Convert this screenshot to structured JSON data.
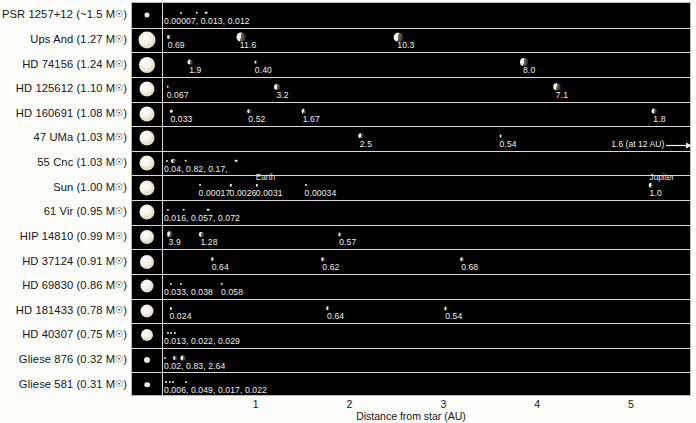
{
  "axis": {
    "title": "Distance from star (AU)",
    "ticks": [
      "1",
      "2",
      "3",
      "4",
      "5"
    ],
    "tick_values": [
      1,
      2,
      3,
      4,
      5
    ],
    "xmin": 0,
    "xmax": 5.62
  },
  "notes": {
    "earth_label": "Earth",
    "jupiter_label": "Jupiter",
    "uma_offscale": "1.6 (at 12 AU)"
  },
  "chart_data": {
    "type": "scatter",
    "title": "",
    "xlabel": "Distance from star (AU)",
    "ylabel": "",
    "xlim": [
      0,
      5.62
    ],
    "grid": false,
    "legend": "none",
    "value_units": "planet mass (Jupiter masses)",
    "rows": [
      {
        "star": "PSR 1257+12",
        "mass": "~1.5",
        "label": "PSR 1257+12 (~1.5 M☉)",
        "star_size": 5,
        "planets": [
          {
            "au": 0.19,
            "value": "0.00007",
            "size": 2
          },
          {
            "au": 0.36,
            "value": "0.013",
            "size": 2.6
          },
          {
            "au": 0.46,
            "value": "0.012",
            "size": 2.6
          }
        ],
        "values_joined": "0.00007, 0.013, 0.012"
      },
      {
        "star": "Ups And",
        "mass": "1.27",
        "label": "Ups And (1.27 M☉)",
        "star_size": 17,
        "planets": [
          {
            "au": 0.06,
            "value": "0.69",
            "size": 4
          },
          {
            "au": 0.83,
            "value": "11.6",
            "size": 9
          },
          {
            "au": 2.51,
            "value": "10.3",
            "size": 8.5
          }
        ]
      },
      {
        "star": "HD 74156",
        "mass": "1.24",
        "label": "HD 74156 (1.24 M☉)",
        "star_size": 16,
        "planets": [
          {
            "au": 0.29,
            "value": "1.9",
            "size": 5
          },
          {
            "au": 0.99,
            "value": "0.40",
            "size": 3.2
          },
          {
            "au": 3.85,
            "value": "8.0",
            "size": 8
          }
        ]
      },
      {
        "star": "HD 125612",
        "mass": "1.10",
        "label": "HD 125612 (1.10 M☉)",
        "star_size": 15,
        "planets": [
          {
            "au": 0.05,
            "value": "0.067",
            "size": 2.6
          },
          {
            "au": 1.22,
            "value": "3.2",
            "size": 6
          },
          {
            "au": 4.2,
            "value": "7.1",
            "size": 7.5
          }
        ]
      },
      {
        "star": "HD 160691",
        "mass": "1.08",
        "label": "HD 160691 (1.08 M☉)",
        "star_size": 15,
        "planets": [
          {
            "au": 0.09,
            "value": "0.033",
            "size": 2.4
          },
          {
            "au": 0.92,
            "value": "0.52",
            "size": 3.6
          },
          {
            "au": 1.5,
            "value": "1.67",
            "size": 4.6
          },
          {
            "au": 5.24,
            "value": "1.8",
            "size": 4.8
          }
        ]
      },
      {
        "star": "47 UMa",
        "mass": "1.03",
        "label": "47 UMa (1.03 M☉)",
        "star_size": 15,
        "planets": [
          {
            "au": 2.11,
            "value": "2.5",
            "size": 5.4
          },
          {
            "au": 3.6,
            "value": "0.54",
            "size": 3.2
          }
        ],
        "offscale": {
          "value": "1.6 (at 12 AU)",
          "au_label_x": 4.78
        }
      },
      {
        "star": "55 Cnc",
        "mass": "1.03",
        "label": "55 Cnc (1.03 M☉)",
        "star_size": 15,
        "planets": [
          {
            "au": 0.04,
            "value": "0.04",
            "size": 2.2
          },
          {
            "au": 0.11,
            "value": "0.82",
            "size": 4.2
          },
          {
            "au": 0.24,
            "value": "0.17",
            "size": 2.6
          },
          {
            "au": 0.78,
            "value": "0.14",
            "size": 2.6
          },
          {
            "au": 5.77,
            "value": "3.9",
            "size": 6.2
          }
        ],
        "values_joined": "0.04, 0.82, 0.17,",
        "values_extra": "0.14"
      },
      {
        "star": "Sun",
        "mass": "1.00",
        "label": "Sun (1.00 M☉)",
        "star_size": 15,
        "planets": [
          {
            "au": 0.39,
            "value": "0.00017",
            "size": 2
          },
          {
            "au": 0.72,
            "value": "0.0026",
            "size": 2.4
          },
          {
            "au": 1.0,
            "value": "0.0031",
            "size": 2.4,
            "name": "Earth"
          },
          {
            "au": 1.52,
            "value": "0.00034",
            "size": 2
          },
          {
            "au": 5.2,
            "value": "1.0",
            "size": 4.4,
            "name": "Jupiter"
          }
        ]
      },
      {
        "star": "61 Vir",
        "mass": "0.95",
        "label": "61 Vir (0.95 M☉)",
        "star_size": 15,
        "planets": [
          {
            "au": 0.05,
            "value": "0.016",
            "size": 2.2
          },
          {
            "au": 0.22,
            "value": "0.057",
            "size": 2.6
          },
          {
            "au": 0.48,
            "value": "0.072",
            "size": 2.6
          }
        ],
        "values_joined": "0.016, 0.057, 0.072"
      },
      {
        "star": "HIP 14810",
        "mass": "0.99",
        "label": "HIP 14810 (0.99 M☉)",
        "star_size": 14,
        "planets": [
          {
            "au": 0.07,
            "value": "3.9",
            "size": 5.6
          },
          {
            "au": 0.41,
            "value": "1.28",
            "size": 4.2
          },
          {
            "au": 1.89,
            "value": "0.57",
            "size": 3.2
          }
        ]
      },
      {
        "star": "HD 37124",
        "mass": "0.91",
        "label": "HD 37124 (0.91 M☉)",
        "star_size": 14,
        "planets": [
          {
            "au": 0.53,
            "value": "0.64",
            "size": 3.6
          },
          {
            "au": 1.71,
            "value": "0.62",
            "size": 3.6
          },
          {
            "au": 3.19,
            "value": "0.68",
            "size": 3.6
          }
        ]
      },
      {
        "star": "HD 69830",
        "mass": "0.86",
        "label": "HD 69830 (0.86 M☉)",
        "star_size": 13,
        "planets": [
          {
            "au": 0.08,
            "value": "0.033",
            "size": 2.2
          },
          {
            "au": 0.19,
            "value": "0.038",
            "size": 2.2
          },
          {
            "au": 0.63,
            "value": "0.058",
            "size": 2.4
          }
        ],
        "values_joined": "0.033, 0.038",
        "values_extra": "0.058"
      },
      {
        "star": "HD 181433",
        "mass": "0.78",
        "label": "HD 181433 (0.78 M☉)",
        "star_size": 13,
        "planets": [
          {
            "au": 0.08,
            "value": "0.024",
            "size": 2.2
          },
          {
            "au": 1.76,
            "value": "0.64",
            "size": 3.4
          },
          {
            "au": 3.02,
            "value": "0.54",
            "size": 3.2
          }
        ]
      },
      {
        "star": "HD 40307",
        "mass": "0.75",
        "label": "HD 40307 (0.75 M☉)",
        "star_size": 12,
        "planets": [
          {
            "au": 0.05,
            "value": "0.013",
            "size": 2
          },
          {
            "au": 0.08,
            "value": "0.022",
            "size": 2.2
          },
          {
            "au": 0.13,
            "value": "0.029",
            "size": 2.2
          }
        ],
        "values_joined": "0.013, 0.022, 0.029"
      },
      {
        "star": "Gliese 876",
        "mass": "0.32",
        "label": "Gliese 876 (0.32 M☉)",
        "star_size": 6,
        "planets": [
          {
            "au": 0.02,
            "value": "0.02",
            "size": 2
          },
          {
            "au": 0.13,
            "value": "0.83",
            "size": 4
          },
          {
            "au": 0.21,
            "value": "2.64",
            "size": 5.2
          }
        ],
        "values_joined": "0.02, 0.83, 2.64"
      },
      {
        "star": "Gliese 581",
        "mass": "0.31",
        "label": "Gliese 581 (0.31 M☉)",
        "star_size": 5.5,
        "planets": [
          {
            "au": 0.03,
            "value": "0.006",
            "size": 1.8
          },
          {
            "au": 0.07,
            "value": "0.049",
            "size": 2.2
          },
          {
            "au": 0.11,
            "value": "0.017",
            "size": 2
          },
          {
            "au": 0.25,
            "value": "0.022",
            "size": 2
          }
        ],
        "values_joined": "0.006, 0.049, 0.017, 0.022"
      }
    ]
  }
}
